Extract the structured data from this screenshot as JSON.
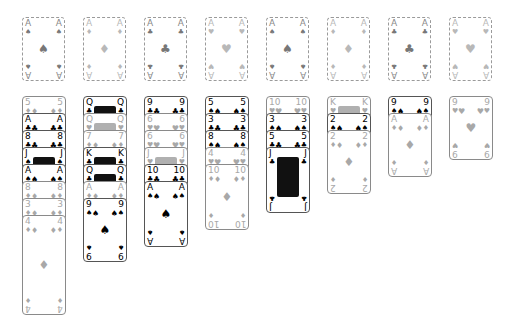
{
  "game": "solitaire",
  "colors": {
    "border": "#555555",
    "dashed": "#9a9a9a",
    "faded_text": "#a8a8a8",
    "black": "#000000"
  },
  "foundations": [
    {
      "rank": "A",
      "suit": "♠",
      "suit_name": "spades",
      "state": "placeholder-dark"
    },
    {
      "rank": "A",
      "suit": "♦",
      "suit_name": "diamonds",
      "state": "placeholder-light"
    },
    {
      "rank": "A",
      "suit": "♣",
      "suit_name": "clubs",
      "state": "placeholder-dark"
    },
    {
      "rank": "A",
      "suit": "♥",
      "suit_name": "hearts",
      "state": "placeholder-light"
    },
    {
      "rank": "A",
      "suit": "♠",
      "suit_name": "spades",
      "state": "placeholder-dark"
    },
    {
      "rank": "A",
      "suit": "♦",
      "suit_name": "diamonds",
      "state": "placeholder-light"
    },
    {
      "rank": "A",
      "suit": "♣",
      "suit_name": "clubs",
      "state": "placeholder-dark"
    },
    {
      "rank": "A",
      "suit": "♥",
      "suit_name": "hearts",
      "state": "placeholder-light"
    }
  ],
  "tableau": [
    {
      "column": 1,
      "cards": [
        {
          "rank": "5",
          "suit": "♦",
          "faded": true
        },
        {
          "rank": "A",
          "suit": "♣",
          "faded": false
        },
        {
          "rank": "8",
          "suit": "♣",
          "faded": false
        },
        {
          "rank": "J",
          "suit": "♠",
          "faded": false,
          "face": true
        },
        {
          "rank": "A",
          "suit": "♠",
          "faded": false
        },
        {
          "rank": "8",
          "suit": "♦",
          "faded": true
        },
        {
          "rank": "3",
          "suit": "♦",
          "faded": true
        },
        {
          "rank": "4",
          "suit": "♦",
          "faded": true
        }
      ]
    },
    {
      "column": 2,
      "cards": [
        {
          "rank": "Q",
          "suit": "♣",
          "faded": false,
          "face": true
        },
        {
          "rank": "Q",
          "suit": "♥",
          "faded": true,
          "face": true
        },
        {
          "rank": "7",
          "suit": "♦",
          "faded": true
        },
        {
          "rank": "K",
          "suit": "♣",
          "faded": false,
          "face": true
        },
        {
          "rank": "Q",
          "suit": "♣",
          "faded": false,
          "face": true
        },
        {
          "rank": "A",
          "suit": "♦",
          "faded": true
        },
        {
          "rank": "9",
          "suit": "♠",
          "faded": false
        }
      ]
    },
    {
      "column": 3,
      "cards": [
        {
          "rank": "9",
          "suit": "♣",
          "faded": false
        },
        {
          "rank": "6",
          "suit": "♥",
          "faded": true
        },
        {
          "rank": "6",
          "suit": "♥",
          "faded": true
        },
        {
          "rank": "J",
          "suit": "♥",
          "faded": true,
          "face": true
        },
        {
          "rank": "10",
          "suit": "♣",
          "faded": false
        },
        {
          "rank": "A",
          "suit": "♠",
          "faded": false
        }
      ]
    },
    {
      "column": 4,
      "cards": [
        {
          "rank": "5",
          "suit": "♠",
          "faded": false
        },
        {
          "rank": "3",
          "suit": "♣",
          "faded": false
        },
        {
          "rank": "8",
          "suit": "♠",
          "faded": false
        },
        {
          "rank": "4",
          "suit": "♥",
          "faded": true
        },
        {
          "rank": "10",
          "suit": "♦",
          "faded": true
        }
      ]
    },
    {
      "column": 5,
      "cards": [
        {
          "rank": "10",
          "suit": "♥",
          "faded": true
        },
        {
          "rank": "3",
          "suit": "♠",
          "faded": false
        },
        {
          "rank": "5",
          "suit": "♣",
          "faded": false
        },
        {
          "rank": "J",
          "suit": "♣",
          "faded": false,
          "face": true
        }
      ]
    },
    {
      "column": 6,
      "cards": [
        {
          "rank": "K",
          "suit": "♥",
          "faded": true,
          "face": true
        },
        {
          "rank": "2",
          "suit": "♠",
          "faded": false
        },
        {
          "rank": "2",
          "suit": "♦",
          "faded": true
        }
      ]
    },
    {
      "column": 7,
      "cards": [
        {
          "rank": "9",
          "suit": "♠",
          "faded": false
        },
        {
          "rank": "A",
          "suit": "♦",
          "faded": true
        }
      ]
    },
    {
      "column": 8,
      "cards": [
        {
          "rank": "9",
          "suit": "♥",
          "faded": true
        }
      ]
    }
  ]
}
